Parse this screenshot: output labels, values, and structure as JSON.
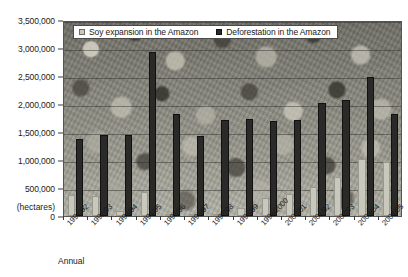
{
  "chart_data": {
    "type": "bar",
    "title": "",
    "xlabel": "Annual",
    "ylabel": "(hectares)",
    "ylim": [
      0,
      3500000
    ],
    "ytick_step": 500000,
    "grid": true,
    "legend_position": "top",
    "categories": [
      "1991/92",
      "1992/93",
      "1993/94",
      "1994/95",
      "1995/96",
      "1996/97",
      "1997/98",
      "1998/99",
      "1999/2000",
      "2000/01",
      "2001/02",
      "2002/03",
      "2003/04",
      "2004/05"
    ],
    "yticks": [
      "0",
      "500,000",
      "1,000,000",
      "1,500,000",
      "2,000,000",
      "2,500,000",
      "3,000,000",
      "3,500,000"
    ],
    "ytick_values": [
      0,
      500000,
      1000000,
      1500000,
      2000000,
      2500000,
      3000000,
      3500000
    ],
    "series": [
      {
        "name": "Soy expansion in the Amazon",
        "color": "#c9c8bd",
        "values": [
          370000,
          350000,
          90000,
          420000,
          30000,
          30000,
          30000,
          140000,
          320000,
          400000,
          520000,
          700000,
          1010000,
          960000
        ]
      },
      {
        "name": "Deforestation in the Amazon",
        "color": "#2a2a28",
        "values": [
          1375000,
          1450000,
          1450000,
          2930000,
          1820000,
          1430000,
          1710000,
          1730000,
          1700000,
          1710000,
          2020000,
          2070000,
          2480000,
          1820000
        ]
      }
    ]
  }
}
